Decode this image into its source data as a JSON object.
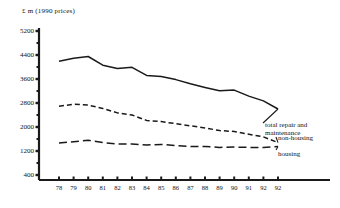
{
  "chart_data": {
    "type": "line",
    "title": "",
    "subtitle": "",
    "ylabel": "£ m  (1990 prices)",
    "xlabel": "",
    "ylim": [
      0,
      5200
    ],
    "y_ticks": [
      5200,
      4400,
      3600,
      2800,
      2000,
      1200,
      400
    ],
    "y_minor_interval": 400,
    "grid": false,
    "legend_position": "right-inline",
    "categories": [
      "78",
      "79",
      "80",
      "81",
      "82",
      "83",
      "84",
      "85",
      "86",
      "87",
      "88",
      "89",
      "90",
      "91",
      "92",
      "92"
    ],
    "series": [
      {
        "name": "total repair and maintenance",
        "style": "solid",
        "values": [
          4190,
          4290,
          4350,
          4060,
          3950,
          3990,
          3720,
          3680,
          3580,
          3440,
          3320,
          3210,
          3230,
          3030,
          2870,
          2600
        ]
      },
      {
        "name": "non-housing",
        "style": "dashed",
        "values": [
          2690,
          2760,
          2730,
          2620,
          2470,
          2400,
          2220,
          2180,
          2110,
          2040,
          1970,
          1880,
          1850,
          1760,
          1670,
          1480
        ]
      },
      {
        "name": "housing",
        "style": "long-dashed",
        "values": [
          1470,
          1510,
          1560,
          1480,
          1430,
          1430,
          1400,
          1420,
          1380,
          1350,
          1350,
          1320,
          1330,
          1320,
          1320,
          1350
        ]
      }
    ],
    "annotations": [
      {
        "text": "total repair and",
        "target": "total repair and maintenance"
      },
      {
        "text": "maintenance",
        "target": "total repair and maintenance"
      },
      {
        "text": "non-housing",
        "target": "non-housing"
      },
      {
        "text": "housing",
        "target": "housing"
      }
    ],
    "colors": {
      "axis": "#1a1a1a",
      "series": "#1a1a1a",
      "background": "#ffffff"
    }
  },
  "labels": {
    "y_axis_title": "£ m  (1990 prices)",
    "y_ticks": [
      "5200",
      "4400",
      "3600",
      "2800",
      "2000",
      "1200",
      "400"
    ],
    "x_ticks": [
      "78",
      "79",
      "80",
      "81",
      "82",
      "83",
      "84",
      "85",
      "86",
      "87",
      "88",
      "89",
      "90",
      "91",
      "92",
      "92"
    ],
    "series_total_line1": "total repair and",
    "series_total_line2": "maintenance",
    "series_nonhousing": "non-housing",
    "series_housing": "housing"
  }
}
